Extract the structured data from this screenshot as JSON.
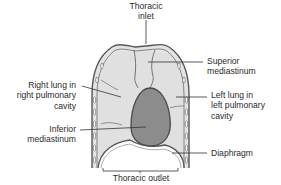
{
  "diagram": {
    "type": "anatomical",
    "colors": {
      "lung": "#e0e0e0",
      "heart": "#8c8c8c",
      "outline": "#5a5a5a",
      "label_text": "#2a2a2a",
      "leader_line": "#333333"
    },
    "labels": {
      "thoracic_inlet": {
        "line1": "Thoracic",
        "line2": "inlet"
      },
      "superior_mediastinum": {
        "line1": "Superior",
        "line2": "mediastinum"
      },
      "right_lung": {
        "line1": "Right lung in",
        "line2": "right pulmonary",
        "line3": "cavity"
      },
      "left_lung": {
        "line1": "Left lung in",
        "line2": "left pulmonary",
        "line3": "cavity"
      },
      "inferior_mediastinum": {
        "line1": "Inferior",
        "line2": "mediastinum"
      },
      "diaphragm": {
        "line1": "Diaphragm"
      },
      "thoracic_outlet": {
        "line1": "Thoracic outlet"
      }
    }
  }
}
